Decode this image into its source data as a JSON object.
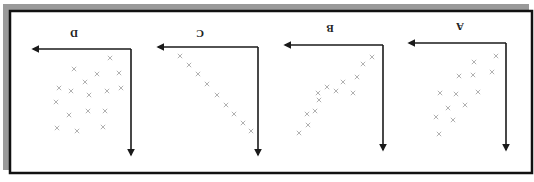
{
  "figure": {
    "orientation": "rotated-180",
    "frame": {
      "border_color": "#111111",
      "shadow_color": "#9a9a9a",
      "background": "#ffffff"
    },
    "marker": {
      "symbol": "×",
      "color": "#a8a8a8"
    },
    "axis_color": "#1a1a1a"
  },
  "chart_data": [
    {
      "type": "scatter",
      "title": "A",
      "xlabel": "",
      "ylabel": "",
      "grid": false,
      "panel": {
        "label_pos": [
          460,
          26
        ],
        "corner": [
          506,
          43
        ],
        "x_axis_end": 409,
        "y_axis_end": 150
      },
      "points": [
        [
          496,
          56
        ],
        [
          474,
          62
        ],
        [
          492,
          72
        ],
        [
          473,
          75
        ],
        [
          459,
          76
        ],
        [
          440,
          93
        ],
        [
          456,
          94
        ],
        [
          478,
          92
        ],
        [
          465,
          105
        ],
        [
          448,
          108
        ],
        [
          436,
          117
        ],
        [
          453,
          120
        ],
        [
          439,
          134
        ]
      ]
    },
    {
      "type": "scatter",
      "title": "B",
      "xlabel": "",
      "ylabel": "",
      "grid": false,
      "panel": {
        "label_pos": [
          330,
          28
        ],
        "corner": [
          383,
          45
        ],
        "x_axis_end": 285,
        "y_axis_end": 150
      },
      "points": [
        [
          372,
          57
        ],
        [
          363,
          64
        ],
        [
          357,
          77
        ],
        [
          343,
          82
        ],
        [
          327,
          87
        ],
        [
          336,
          91
        ],
        [
          353,
          93
        ],
        [
          318,
          93
        ],
        [
          319,
          100
        ],
        [
          315,
          111
        ],
        [
          307,
          114
        ],
        [
          308,
          125
        ],
        [
          299,
          133
        ]
      ]
    },
    {
      "type": "scatter",
      "title": "C",
      "xlabel": "",
      "ylabel": "",
      "grid": false,
      "panel": {
        "label_pos": [
          200,
          33
        ],
        "corner": [
          258,
          47
        ],
        "x_axis_end": 158,
        "y_axis_end": 155
      },
      "points": [
        [
          180,
          56
        ],
        [
          189,
          65
        ],
        [
          198,
          74
        ],
        [
          207,
          84
        ],
        [
          217,
          95
        ],
        [
          226,
          105
        ],
        [
          234,
          114
        ],
        [
          243,
          123
        ],
        [
          251,
          131
        ]
      ]
    },
    {
      "type": "scatter",
      "title": "D",
      "xlabel": "",
      "ylabel": "",
      "grid": false,
      "panel": {
        "label_pos": [
          74,
          33
        ],
        "corner": [
          131,
          49
        ],
        "x_axis_end": 33,
        "y_axis_end": 155
      },
      "points": [
        [
          110,
          58
        ],
        [
          74,
          69
        ],
        [
          97,
          74
        ],
        [
          119,
          73
        ],
        [
          85,
          82
        ],
        [
          59,
          88
        ],
        [
          71,
          91
        ],
        [
          89,
          95
        ],
        [
          107,
          91
        ],
        [
          121,
          88
        ],
        [
          56,
          102
        ],
        [
          69,
          115
        ],
        [
          88,
          111
        ],
        [
          105,
          111
        ],
        [
          57,
          128
        ],
        [
          77,
          131
        ],
        [
          103,
          127
        ]
      ]
    }
  ]
}
